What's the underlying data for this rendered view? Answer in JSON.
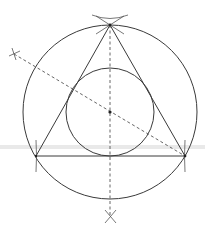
{
  "diagram": {
    "type": "geometric-construction",
    "stroke_color": "#3a3a3a",
    "dash_color": "#555555",
    "outer_circle": {
      "cx": 110,
      "cy": 112,
      "r": 87
    },
    "inner_circle": {
      "cx": 110,
      "cy": 112,
      "r": 44
    },
    "triangle": {
      "vertices": [
        {
          "name": "top",
          "x": 110,
          "y": 25
        },
        {
          "name": "bottom-left",
          "x": 36,
          "y": 156
        },
        {
          "name": "bottom-right",
          "x": 185,
          "y": 156
        }
      ]
    },
    "center_point": {
      "x": 110,
      "y": 112
    },
    "bisectors": [
      {
        "name": "vertical",
        "x1": 110,
        "y1": 25,
        "x2": 110,
        "y2": 217
      },
      {
        "name": "diagonal",
        "x1": 14,
        "y1": 54,
        "x2": 185,
        "y2": 156
      }
    ],
    "construction_marks": [
      {
        "name": "top-intersection",
        "x": 110,
        "y": 25
      },
      {
        "name": "bottom-cross",
        "x": 110,
        "y": 216
      },
      {
        "name": "left-cross",
        "x": 14,
        "y": 54
      },
      {
        "name": "bottom-left-tick",
        "x": 36,
        "y": 156
      },
      {
        "name": "bottom-right-tick",
        "x": 185,
        "y": 156
      }
    ]
  }
}
